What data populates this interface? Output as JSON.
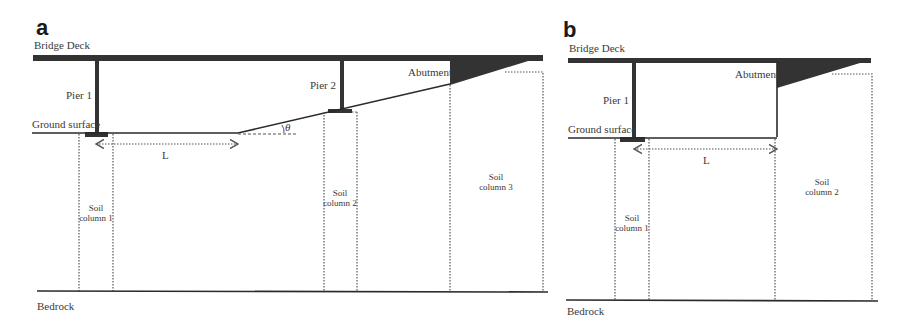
{
  "figure": {
    "panels": [
      {
        "id": "a",
        "letter": "a",
        "labels": {
          "bridge_deck": "Bridge Deck",
          "pier1": "Pier 1",
          "pier2": "Pier 2",
          "abutment": "Abutment",
          "ground_surface": "Ground surface",
          "span_length": "L",
          "slope_angle": "θ",
          "soil_column1_line1": "Soil",
          "soil_column1_line2": "column 1",
          "soil_column2_line1": "Soil",
          "soil_column2_line2": "column 2",
          "soil_column3_line1": "Soil",
          "soil_column3_line2": "column 3",
          "bedrock": "Bedrock"
        }
      },
      {
        "id": "b",
        "letter": "b",
        "labels": {
          "bridge_deck": "Bridge Deck",
          "pier1": "Pier 1",
          "abutment": "Abutment",
          "ground_surface": "Ground surface",
          "span_length": "L",
          "soil_column1_line1": "Soil",
          "soil_column1_line2": "column 1",
          "soil_column2_line1": "Soil",
          "soil_column2_line2": "column 2",
          "bedrock": "Bedrock"
        }
      }
    ],
    "colors": {
      "structure": "#333333",
      "text": "#3a3a3a",
      "background": "#ffffff"
    }
  }
}
